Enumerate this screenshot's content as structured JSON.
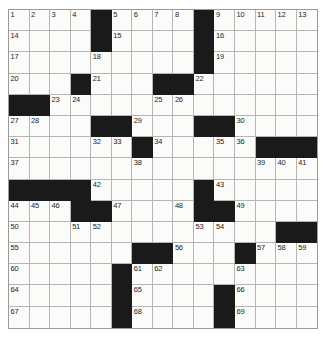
{
  "puzzle": {
    "title": "Crossword Grid",
    "rows": 15,
    "columns": 15,
    "colors": {
      "block": "#1a1a1a",
      "cell": "#fbfbf9",
      "gridline": "#b5b5b5",
      "border": "#9a9a9a",
      "number": "#1d1d1d"
    },
    "grid": [
      [
        {
          "b": false,
          "n": "1"
        },
        {
          "b": false,
          "n": "2"
        },
        {
          "b": false,
          "n": "3"
        },
        {
          "b": false,
          "n": "4"
        },
        {
          "b": true,
          "n": ""
        },
        {
          "b": false,
          "n": "5"
        },
        {
          "b": false,
          "n": "6"
        },
        {
          "b": false,
          "n": "7"
        },
        {
          "b": false,
          "n": "8"
        },
        {
          "b": true,
          "n": ""
        },
        {
          "b": false,
          "n": "9"
        },
        {
          "b": false,
          "n": "10"
        },
        {
          "b": false,
          "n": "11"
        },
        {
          "b": false,
          "n": "12"
        },
        {
          "b": false,
          "n": "13"
        }
      ],
      [
        {
          "b": false,
          "n": "14"
        },
        {
          "b": false,
          "n": ""
        },
        {
          "b": false,
          "n": ""
        },
        {
          "b": false,
          "n": ""
        },
        {
          "b": true,
          "n": ""
        },
        {
          "b": false,
          "n": "15"
        },
        {
          "b": false,
          "n": ""
        },
        {
          "b": false,
          "n": ""
        },
        {
          "b": false,
          "n": ""
        },
        {
          "b": true,
          "n": ""
        },
        {
          "b": false,
          "n": "16"
        },
        {
          "b": false,
          "n": ""
        },
        {
          "b": false,
          "n": ""
        },
        {
          "b": false,
          "n": ""
        },
        {
          "b": false,
          "n": ""
        }
      ],
      [
        {
          "b": false,
          "n": "17"
        },
        {
          "b": false,
          "n": ""
        },
        {
          "b": false,
          "n": ""
        },
        {
          "b": false,
          "n": ""
        },
        {
          "b": false,
          "n": "18"
        },
        {
          "b": false,
          "n": ""
        },
        {
          "b": false,
          "n": ""
        },
        {
          "b": false,
          "n": ""
        },
        {
          "b": false,
          "n": ""
        },
        {
          "b": true,
          "n": ""
        },
        {
          "b": false,
          "n": "19"
        },
        {
          "b": false,
          "n": ""
        },
        {
          "b": false,
          "n": ""
        },
        {
          "b": false,
          "n": ""
        },
        {
          "b": false,
          "n": ""
        }
      ],
      [
        {
          "b": false,
          "n": "20"
        },
        {
          "b": false,
          "n": ""
        },
        {
          "b": false,
          "n": ""
        },
        {
          "b": true,
          "n": ""
        },
        {
          "b": false,
          "n": "21"
        },
        {
          "b": false,
          "n": ""
        },
        {
          "b": false,
          "n": ""
        },
        {
          "b": true,
          "n": ""
        },
        {
          "b": true,
          "n": ""
        },
        {
          "b": false,
          "n": "22"
        },
        {
          "b": false,
          "n": ""
        },
        {
          "b": false,
          "n": ""
        },
        {
          "b": false,
          "n": ""
        },
        {
          "b": false,
          "n": ""
        },
        {
          "b": false,
          "n": ""
        }
      ],
      [
        {
          "b": true,
          "n": ""
        },
        {
          "b": true,
          "n": ""
        },
        {
          "b": false,
          "n": "23"
        },
        {
          "b": false,
          "n": "24"
        },
        {
          "b": false,
          "n": ""
        },
        {
          "b": false,
          "n": ""
        },
        {
          "b": false,
          "n": ""
        },
        {
          "b": false,
          "n": "25"
        },
        {
          "b": false,
          "n": "26"
        },
        {
          "b": false,
          "n": ""
        },
        {
          "b": false,
          "n": ""
        },
        {
          "b": false,
          "n": ""
        },
        {
          "b": false,
          "n": ""
        },
        {
          "b": false,
          "n": ""
        },
        {
          "b": false,
          "n": ""
        }
      ],
      [
        {
          "b": false,
          "n": "27"
        },
        {
          "b": false,
          "n": "28"
        },
        {
          "b": false,
          "n": ""
        },
        {
          "b": false,
          "n": ""
        },
        {
          "b": true,
          "n": ""
        },
        {
          "b": true,
          "n": ""
        },
        {
          "b": false,
          "n": "29"
        },
        {
          "b": false,
          "n": ""
        },
        {
          "b": false,
          "n": ""
        },
        {
          "b": true,
          "n": ""
        },
        {
          "b": true,
          "n": ""
        },
        {
          "b": false,
          "n": "30"
        },
        {
          "b": false,
          "n": ""
        },
        {
          "b": false,
          "n": ""
        },
        {
          "b": false,
          "n": ""
        }
      ],
      [
        {
          "b": false,
          "n": "31"
        },
        {
          "b": false,
          "n": ""
        },
        {
          "b": false,
          "n": ""
        },
        {
          "b": false,
          "n": ""
        },
        {
          "b": false,
          "n": "32"
        },
        {
          "b": false,
          "n": "33"
        },
        {
          "b": true,
          "n": ""
        },
        {
          "b": false,
          "n": "34"
        },
        {
          "b": false,
          "n": ""
        },
        {
          "b": false,
          "n": ""
        },
        {
          "b": false,
          "n": "35"
        },
        {
          "b": false,
          "n": "36"
        },
        {
          "b": true,
          "n": ""
        },
        {
          "b": true,
          "n": ""
        },
        {
          "b": true,
          "n": ""
        }
      ],
      [
        {
          "b": false,
          "n": "37"
        },
        {
          "b": false,
          "n": ""
        },
        {
          "b": false,
          "n": ""
        },
        {
          "b": false,
          "n": ""
        },
        {
          "b": false,
          "n": ""
        },
        {
          "b": false,
          "n": ""
        },
        {
          "b": false,
          "n": "38"
        },
        {
          "b": false,
          "n": ""
        },
        {
          "b": false,
          "n": ""
        },
        {
          "b": false,
          "n": ""
        },
        {
          "b": false,
          "n": ""
        },
        {
          "b": false,
          "n": ""
        },
        {
          "b": false,
          "n": "39"
        },
        {
          "b": false,
          "n": "40"
        },
        {
          "b": false,
          "n": "41"
        }
      ],
      [
        {
          "b": true,
          "n": ""
        },
        {
          "b": true,
          "n": ""
        },
        {
          "b": true,
          "n": ""
        },
        {
          "b": true,
          "n": ""
        },
        {
          "b": false,
          "n": "42"
        },
        {
          "b": false,
          "n": ""
        },
        {
          "b": false,
          "n": ""
        },
        {
          "b": false,
          "n": ""
        },
        {
          "b": false,
          "n": ""
        },
        {
          "b": true,
          "n": ""
        },
        {
          "b": false,
          "n": "43"
        },
        {
          "b": false,
          "n": ""
        },
        {
          "b": false,
          "n": ""
        },
        {
          "b": false,
          "n": ""
        },
        {
          "b": false,
          "n": ""
        }
      ],
      [
        {
          "b": false,
          "n": "44"
        },
        {
          "b": false,
          "n": "45"
        },
        {
          "b": false,
          "n": "46"
        },
        {
          "b": true,
          "n": ""
        },
        {
          "b": true,
          "n": ""
        },
        {
          "b": false,
          "n": "47"
        },
        {
          "b": false,
          "n": ""
        },
        {
          "b": false,
          "n": ""
        },
        {
          "b": false,
          "n": "48"
        },
        {
          "b": true,
          "n": ""
        },
        {
          "b": true,
          "n": ""
        },
        {
          "b": false,
          "n": "49"
        },
        {
          "b": false,
          "n": ""
        },
        {
          "b": false,
          "n": ""
        },
        {
          "b": false,
          "n": ""
        }
      ],
      [
        {
          "b": false,
          "n": "50"
        },
        {
          "b": false,
          "n": ""
        },
        {
          "b": false,
          "n": ""
        },
        {
          "b": false,
          "n": "51"
        },
        {
          "b": false,
          "n": "52"
        },
        {
          "b": false,
          "n": ""
        },
        {
          "b": false,
          "n": ""
        },
        {
          "b": false,
          "n": ""
        },
        {
          "b": false,
          "n": ""
        },
        {
          "b": false,
          "n": "53"
        },
        {
          "b": false,
          "n": "54"
        },
        {
          "b": false,
          "n": ""
        },
        {
          "b": false,
          "n": ""
        },
        {
          "b": true,
          "n": ""
        },
        {
          "b": true,
          "n": ""
        }
      ],
      [
        {
          "b": false,
          "n": "55"
        },
        {
          "b": false,
          "n": ""
        },
        {
          "b": false,
          "n": ""
        },
        {
          "b": false,
          "n": ""
        },
        {
          "b": false,
          "n": ""
        },
        {
          "b": false,
          "n": ""
        },
        {
          "b": true,
          "n": ""
        },
        {
          "b": true,
          "n": ""
        },
        {
          "b": false,
          "n": "56"
        },
        {
          "b": false,
          "n": ""
        },
        {
          "b": false,
          "n": ""
        },
        {
          "b": true,
          "n": ""
        },
        {
          "b": false,
          "n": "57"
        },
        {
          "b": false,
          "n": "58"
        },
        {
          "b": false,
          "n": "59"
        }
      ],
      [
        {
          "b": false,
          "n": "60"
        },
        {
          "b": false,
          "n": ""
        },
        {
          "b": false,
          "n": ""
        },
        {
          "b": false,
          "n": ""
        },
        {
          "b": false,
          "n": ""
        },
        {
          "b": true,
          "n": ""
        },
        {
          "b": false,
          "n": "61"
        },
        {
          "b": false,
          "n": "62"
        },
        {
          "b": false,
          "n": ""
        },
        {
          "b": false,
          "n": ""
        },
        {
          "b": false,
          "n": ""
        },
        {
          "b": false,
          "n": "63"
        },
        {
          "b": false,
          "n": ""
        },
        {
          "b": false,
          "n": ""
        },
        {
          "b": false,
          "n": ""
        }
      ],
      [
        {
          "b": false,
          "n": "64"
        },
        {
          "b": false,
          "n": ""
        },
        {
          "b": false,
          "n": ""
        },
        {
          "b": false,
          "n": ""
        },
        {
          "b": false,
          "n": ""
        },
        {
          "b": true,
          "n": ""
        },
        {
          "b": false,
          "n": "65"
        },
        {
          "b": false,
          "n": ""
        },
        {
          "b": false,
          "n": ""
        },
        {
          "b": false,
          "n": ""
        },
        {
          "b": true,
          "n": ""
        },
        {
          "b": false,
          "n": "66"
        },
        {
          "b": false,
          "n": ""
        },
        {
          "b": false,
          "n": ""
        },
        {
          "b": false,
          "n": ""
        }
      ],
      [
        {
          "b": false,
          "n": "67"
        },
        {
          "b": false,
          "n": ""
        },
        {
          "b": false,
          "n": ""
        },
        {
          "b": false,
          "n": ""
        },
        {
          "b": false,
          "n": ""
        },
        {
          "b": true,
          "n": ""
        },
        {
          "b": false,
          "n": "68"
        },
        {
          "b": false,
          "n": ""
        },
        {
          "b": false,
          "n": ""
        },
        {
          "b": false,
          "n": ""
        },
        {
          "b": true,
          "n": ""
        },
        {
          "b": false,
          "n": "69"
        },
        {
          "b": false,
          "n": ""
        },
        {
          "b": false,
          "n": ""
        },
        {
          "b": false,
          "n": ""
        }
      ]
    ]
  }
}
